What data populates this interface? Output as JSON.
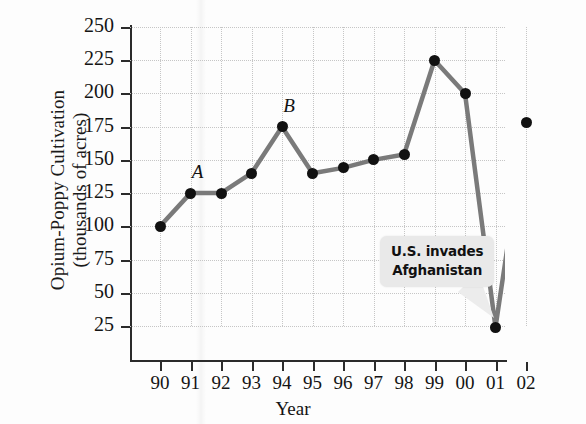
{
  "chart_data": {
    "type": "line",
    "title": "",
    "xlabel": "Year",
    "ylabel_line1": "Opium-Poppy Cultivation",
    "ylabel_line2": "(thousands of acres)",
    "categories": [
      "90",
      "91",
      "92",
      "93",
      "94",
      "95",
      "96",
      "97",
      "98",
      "99",
      "00",
      "01",
      "02"
    ],
    "values": [
      100,
      125,
      125,
      140,
      175,
      140,
      144,
      150,
      154,
      225,
      200,
      24,
      178
    ],
    "ylim": [
      0,
      250
    ],
    "yticks": [
      25,
      50,
      75,
      100,
      125,
      150,
      175,
      200,
      225,
      250
    ],
    "ytick_labels": [
      "25",
      "50",
      "75",
      "100",
      "125",
      "150",
      "175",
      "200",
      "225",
      "250"
    ],
    "grid": true,
    "legend": "none",
    "series_color": "#7a7a7a",
    "marker_color": "#111111",
    "point_labels": [
      {
        "category": "91",
        "label": "A"
      },
      {
        "category": "94",
        "label": "B"
      }
    ],
    "annotations": [
      {
        "name": "us-invades-afghanistan",
        "line1": "U.S. invades",
        "line2": "Afghanistan",
        "points_to": "01",
        "background": "#e9e9e9"
      }
    ]
  }
}
